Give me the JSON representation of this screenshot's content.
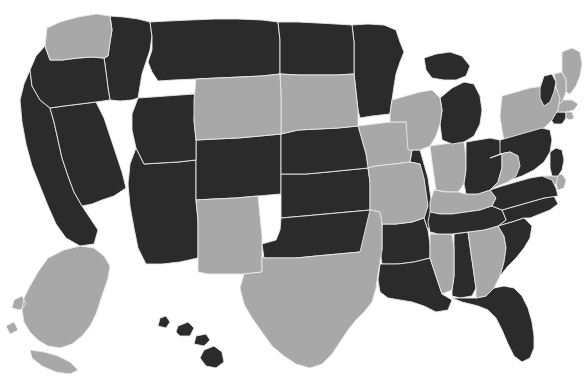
{
  "map": {
    "title": "United States Choropleth Map",
    "type": "choropleth",
    "projection": "albers-usa",
    "background_color": "#ffffff",
    "border_color": "#e9e9e9",
    "watermark_text": "",
    "legend": {
      "visible": false,
      "categories": [
        {
          "key": "dark",
          "label": "Selected",
          "color": "#2b2b2b"
        },
        {
          "key": "light",
          "label": "Not selected",
          "color": "#a8a8a8"
        }
      ]
    },
    "counts": {
      "dark": 30,
      "light": 20,
      "total": 50
    }
  },
  "chart_data": {
    "type": "map",
    "value_colors": {
      "dark": "#2b2b2b",
      "light": "#a8a8a8"
    },
    "states": [
      {
        "code": "AL",
        "name": "Alabama",
        "value": "dark"
      },
      {
        "code": "AK",
        "name": "Alaska",
        "value": "light"
      },
      {
        "code": "AZ",
        "name": "Arizona",
        "value": "dark"
      },
      {
        "code": "AR",
        "name": "Arkansas",
        "value": "dark"
      },
      {
        "code": "CA",
        "name": "California",
        "value": "dark"
      },
      {
        "code": "CO",
        "name": "Colorado",
        "value": "dark"
      },
      {
        "code": "CT",
        "name": "Connecticut",
        "value": "dark"
      },
      {
        "code": "DE",
        "name": "Delaware",
        "value": "light"
      },
      {
        "code": "FL",
        "name": "Florida",
        "value": "dark"
      },
      {
        "code": "GA",
        "name": "Georgia",
        "value": "light"
      },
      {
        "code": "HI",
        "name": "Hawaii",
        "value": "dark"
      },
      {
        "code": "ID",
        "name": "Idaho",
        "value": "dark"
      },
      {
        "code": "IL",
        "name": "Illinois",
        "value": "dark"
      },
      {
        "code": "IN",
        "name": "Indiana",
        "value": "light"
      },
      {
        "code": "IA",
        "name": "Iowa",
        "value": "light"
      },
      {
        "code": "KS",
        "name": "Kansas",
        "value": "dark"
      },
      {
        "code": "KY",
        "name": "Kentucky",
        "value": "light"
      },
      {
        "code": "LA",
        "name": "Louisiana",
        "value": "dark"
      },
      {
        "code": "ME",
        "name": "Maine",
        "value": "light"
      },
      {
        "code": "MD",
        "name": "Maryland",
        "value": "light"
      },
      {
        "code": "MA",
        "name": "Massachusetts",
        "value": "light"
      },
      {
        "code": "MI",
        "name": "Michigan",
        "value": "dark"
      },
      {
        "code": "MN",
        "name": "Minnesota",
        "value": "dark"
      },
      {
        "code": "MS",
        "name": "Mississippi",
        "value": "light"
      },
      {
        "code": "MO",
        "name": "Missouri",
        "value": "light"
      },
      {
        "code": "MT",
        "name": "Montana",
        "value": "dark"
      },
      {
        "code": "NE",
        "name": "Nebraska",
        "value": "dark"
      },
      {
        "code": "NV",
        "name": "Nevada",
        "value": "dark"
      },
      {
        "code": "NH",
        "name": "New Hampshire",
        "value": "light"
      },
      {
        "code": "NJ",
        "name": "New Jersey",
        "value": "dark"
      },
      {
        "code": "NM",
        "name": "New Mexico",
        "value": "light"
      },
      {
        "code": "NY",
        "name": "New York",
        "value": "light"
      },
      {
        "code": "NC",
        "name": "North Carolina",
        "value": "dark"
      },
      {
        "code": "ND",
        "name": "North Dakota",
        "value": "dark"
      },
      {
        "code": "OH",
        "name": "Ohio",
        "value": "dark"
      },
      {
        "code": "OK",
        "name": "Oklahoma",
        "value": "dark"
      },
      {
        "code": "OR",
        "name": "Oregon",
        "value": "dark"
      },
      {
        "code": "PA",
        "name": "Pennsylvania",
        "value": "dark"
      },
      {
        "code": "RI",
        "name": "Rhode Island",
        "value": "light"
      },
      {
        "code": "SC",
        "name": "South Carolina",
        "value": "dark"
      },
      {
        "code": "SD",
        "name": "South Dakota",
        "value": "light"
      },
      {
        "code": "TN",
        "name": "Tennessee",
        "value": "dark"
      },
      {
        "code": "TX",
        "name": "Texas",
        "value": "light"
      },
      {
        "code": "UT",
        "name": "Utah",
        "value": "dark"
      },
      {
        "code": "VT",
        "name": "Vermont",
        "value": "dark"
      },
      {
        "code": "VA",
        "name": "Virginia",
        "value": "dark"
      },
      {
        "code": "WA",
        "name": "Washington",
        "value": "light"
      },
      {
        "code": "WV",
        "name": "West Virginia",
        "value": "light"
      },
      {
        "code": "WI",
        "name": "Wisconsin",
        "value": "light"
      },
      {
        "code": "WY",
        "name": "Wyoming",
        "value": "light"
      }
    ]
  }
}
